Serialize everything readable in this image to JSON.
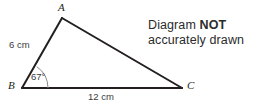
{
  "figure": {
    "type": "geometry-triangle-diagram",
    "vertices": [
      {
        "id": "A",
        "label": "A",
        "x": 62,
        "y": 18
      },
      {
        "id": "B",
        "label": "B",
        "x": 22,
        "y": 88
      },
      {
        "id": "C",
        "label": "C",
        "x": 182,
        "y": 88
      }
    ],
    "sides": [
      {
        "id": "AB",
        "label": "6 cm",
        "from": "B",
        "to": "A"
      },
      {
        "id": "BC",
        "label": "12 cm",
        "from": "B",
        "to": "C"
      },
      {
        "id": "AC",
        "label": "",
        "from": "A",
        "to": "C"
      }
    ],
    "angles": [
      {
        "id": "B",
        "label": "67°",
        "vertex": "B",
        "value": 67
      }
    ],
    "stroke_color": "#231f20",
    "arc_color": "#6f6f6f",
    "background": "#ffffff"
  },
  "note": {
    "line1_prefix": "Diagram ",
    "line1_strong": "NOT",
    "line2": "accurately drawn"
  }
}
